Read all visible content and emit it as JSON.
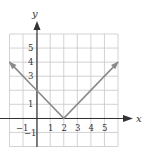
{
  "chart_data": {
    "type": "line",
    "title": "",
    "function": "y = |x - 2|",
    "xlabel": "x",
    "ylabel": "y",
    "xlim": [
      -2,
      6
    ],
    "ylim": [
      -2,
      6
    ],
    "grid": true,
    "x_tick_labels": [
      "-1",
      "1",
      "2",
      "3",
      "4",
      "5"
    ],
    "x_tick_values": [
      -1,
      1,
      2,
      3,
      4,
      5
    ],
    "y_tick_labels": [
      "5",
      "4",
      "3",
      "1",
      "-1"
    ],
    "y_tick_values": [
      5,
      4,
      3,
      1,
      -1
    ],
    "series": [
      {
        "name": "y = |x - 2|",
        "x": [
          -2,
          0,
          2,
          6
        ],
        "y": [
          4,
          2,
          0,
          4
        ],
        "arrows_at_ends": true,
        "color": "#8a8a8a"
      }
    ],
    "legend": null
  },
  "colors": {
    "grid": "#c8c8c8",
    "axis": "#333333",
    "curve": "#8a8a8a"
  },
  "labels": {
    "x_axis": "x",
    "y_axis": "y",
    "x_ticks": {
      "m1": "−1",
      "p1": "1",
      "p2": "2",
      "p3": "3",
      "p4": "4",
      "p5": "5"
    },
    "y_ticks": {
      "p5": "5",
      "p4": "4",
      "p3": "3",
      "p1": "1",
      "m1": "−1"
    }
  }
}
